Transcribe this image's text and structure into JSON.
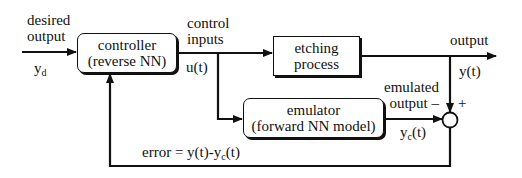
{
  "diagram": {
    "blocks": {
      "controller": {
        "line1": "controller",
        "line2": "(reverse NN)"
      },
      "plant": {
        "line1": "etching",
        "line2": "process"
      },
      "emulator": {
        "line1": "emulator",
        "line2": "(forward NN model)"
      }
    },
    "labels": {
      "desired_output_line1": "desired",
      "desired_output_line2": "output",
      "yd_main": "y",
      "yd_sub": "d",
      "control_inputs_line1": "control",
      "control_inputs_line2": "inputs",
      "ut": "u(t)",
      "output": "output",
      "yt": "y(t)",
      "emulated_line1": "emulated",
      "emulated_line2": "output –",
      "plus": "+",
      "yc_main": "y",
      "yc_sub": "c",
      "yc_tail": "(t)",
      "error_prefix": "error = y(t)-y",
      "error_sub": "c",
      "error_tail": "(t)"
    },
    "summing_junction": {
      "inputs": [
        "+ y(t)",
        "– y_c(t)"
      ],
      "output": "error"
    }
  }
}
